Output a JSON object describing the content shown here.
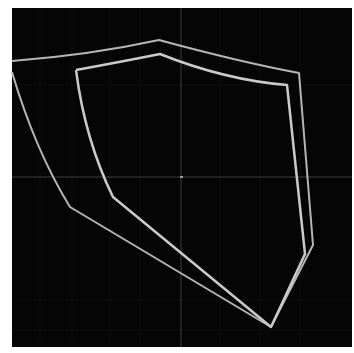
{
  "image": {
    "width": 354,
    "height": 353,
    "background": "#ffffff",
    "canvas": {
      "x": 12,
      "y": 8,
      "width": 340,
      "height": 339,
      "color": "#050505"
    },
    "crosshair": {
      "x": 181,
      "y": 177,
      "color": "#4a4a4a"
    },
    "shields": [
      {
        "name": "outer-shield",
        "stroke": "#b8b8b8",
        "points": "12,61 159,40 299,73 313,245 271,327 70,207 12,72"
      },
      {
        "name": "inner-shield",
        "stroke": "#c8c8c8",
        "points": "76,70 160,54 287,85 305,254 271,327 113,197 76,70"
      }
    ]
  }
}
